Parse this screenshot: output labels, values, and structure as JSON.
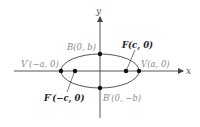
{
  "diagram": {
    "type": "ellipse-with-foci",
    "axes": {
      "x_label": "x",
      "y_label": "y"
    },
    "points": {
      "vertex_right": "V(a, 0)",
      "vertex_left": "V′(−a, 0)",
      "covertex_top": "B(0, b)",
      "covertex_bottom": "B′(0, −b)",
      "focus_right": "F(c, 0)",
      "focus_left": "F′(−c, 0)"
    },
    "colors": {
      "curve": "#555555",
      "axis": "#444444",
      "point": "#111111",
      "label_gray": "#8a8a8a",
      "label_dark": "#222222"
    }
  }
}
